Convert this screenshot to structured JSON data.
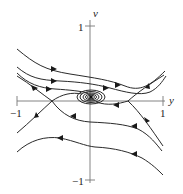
{
  "diagram": {
    "type": "phase-portrait",
    "axes": {
      "horizontal": {
        "label": "y",
        "min_label": "−1",
        "max_label": "1",
        "range": [
          -1,
          1
        ]
      },
      "vertical": {
        "label": "v",
        "min_label": "−1",
        "max_label": "1",
        "range": [
          -1,
          1
        ]
      }
    },
    "equilibria": [
      {
        "kind": "spiral-sink",
        "y": 0.0,
        "v": 0.05
      },
      {
        "kind": "saddle",
        "y": -0.52,
        "v": 0.0
      },
      {
        "kind": "saddle",
        "y": 0.52,
        "v": 0.0
      }
    ],
    "trajectories": [
      {
        "name": "top-curve",
        "points": [
          [
            -0.98,
            0.52
          ],
          [
            -0.6,
            0.27
          ],
          [
            -0.3,
            0.22
          ],
          [
            0.0,
            0.19
          ],
          [
            0.4,
            0.09
          ],
          [
            0.7,
            0.06
          ],
          [
            0.98,
            0.25
          ]
        ],
        "arrow_dir": "right"
      },
      {
        "name": "upper-mid-curve",
        "points": [
          [
            -0.98,
            0.33
          ],
          [
            -0.7,
            0.15
          ],
          [
            -0.4,
            0.12
          ],
          [
            0.0,
            0.12
          ],
          [
            0.4,
            0.06
          ],
          [
            0.7,
            0.0
          ],
          [
            0.98,
            0.2
          ]
        ],
        "arrow_dir": "right"
      },
      {
        "name": "upper-inner-curve",
        "points": [
          [
            -0.98,
            0.27
          ],
          [
            -0.7,
            0.07
          ],
          [
            -0.4,
            0.05
          ],
          [
            -0.1,
            0.07
          ]
        ],
        "arrow_dir": "right"
      },
      {
        "name": "separatrix-left-in",
        "points": [
          [
            -0.98,
            0.24
          ],
          [
            -0.8,
            0.1
          ],
          [
            -0.52,
            0.0
          ]
        ],
        "arrow_dir": "right"
      },
      {
        "name": "separatrix-left-out",
        "points": [
          [
            -0.52,
            0.0
          ],
          [
            -0.8,
            -0.17
          ],
          [
            -0.98,
            -0.33
          ]
        ],
        "arrow_dir": "left"
      },
      {
        "name": "saddle-left-to-sink",
        "points": [
          [
            -0.52,
            0.0
          ],
          [
            -0.3,
            0.07
          ],
          [
            -0.1,
            0.08
          ]
        ],
        "arrow_dir": "right"
      },
      {
        "name": "separatrix-right-in",
        "points": [
          [
            0.98,
            -0.47
          ],
          [
            0.7,
            -0.2
          ],
          [
            0.52,
            0.0
          ]
        ],
        "arrow_dir": "up"
      },
      {
        "name": "separatrix-right-out",
        "points": [
          [
            0.52,
            0.0
          ],
          [
            0.75,
            0.1
          ],
          [
            0.98,
            0.22
          ]
        ],
        "arrow_dir": "up"
      },
      {
        "name": "saddle-right-to-sink",
        "points": [
          [
            0.52,
            0.0
          ],
          [
            0.3,
            -0.05
          ],
          [
            0.1,
            -0.03
          ]
        ],
        "arrow_dir": "left"
      },
      {
        "name": "lower-mid-curve",
        "points": [
          [
            -0.52,
            0.0
          ],
          [
            -0.25,
            -0.08
          ],
          [
            0.0,
            -0.13
          ],
          [
            0.4,
            -0.14
          ],
          [
            0.7,
            -0.2
          ],
          [
            0.95,
            -0.45
          ]
        ],
        "arrow_dir": "left"
      },
      {
        "name": "bottom-curve",
        "points": [
          [
            -0.98,
            -0.55
          ],
          [
            -0.7,
            -0.35
          ],
          [
            -0.4,
            -0.32
          ],
          [
            0.0,
            -0.46
          ],
          [
            0.4,
            -0.5
          ],
          [
            0.7,
            -0.58
          ],
          [
            0.98,
            -0.78
          ]
        ],
        "arrow_dir": "left"
      }
    ]
  }
}
